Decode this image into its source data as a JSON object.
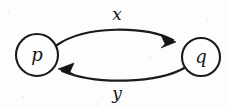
{
  "figure": {
    "kind": "state-transition-diagram",
    "background_color": "#fdfdfd",
    "ink_color": "#1b1b1b",
    "nodes": [
      {
        "id": "p",
        "label": "p",
        "cx": 37,
        "cy": 55,
        "r": 21
      },
      {
        "id": "q",
        "label": "q",
        "cx": 201,
        "cy": 57,
        "r": 19
      }
    ],
    "edges": [
      {
        "id": "edge-x",
        "label": "x",
        "from": "p",
        "to": "q",
        "direction": "right",
        "position": "top",
        "label_x": 117,
        "label_y": 15
      },
      {
        "id": "edge-y",
        "label": "y",
        "from": "q",
        "to": "p",
        "direction": "left",
        "position": "bottom",
        "label_x": 117,
        "label_y": 94
      }
    ]
  }
}
